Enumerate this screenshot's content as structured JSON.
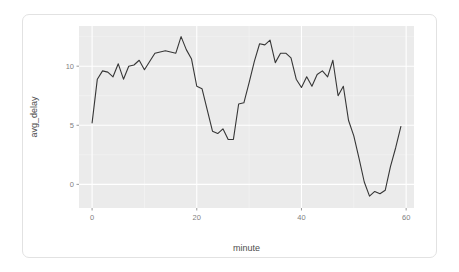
{
  "chart_data": {
    "type": "line",
    "title": "",
    "subtitle": "",
    "xlabel": "minute",
    "ylabel": "avg_delay",
    "xlim": [
      -2.5,
      61.5
    ],
    "ylim": [
      -2.0,
      13.4
    ],
    "xticks": [
      0,
      20,
      40,
      60
    ],
    "xtick_labels": [
      "0",
      "20",
      "40",
      "60"
    ],
    "yticks": [
      0,
      5,
      10
    ],
    "ytick_labels": [
      "0",
      "5",
      "10"
    ],
    "grid": true,
    "grid_major": true,
    "grid_minor": true,
    "legend": "none",
    "series": [
      {
        "name": "avg_delay",
        "color": "#363636",
        "linewidth": 1.1,
        "x": [
          0,
          1,
          2,
          3,
          4,
          5,
          6,
          7,
          8,
          9,
          10,
          11,
          12,
          13,
          14,
          15,
          16,
          17,
          18,
          19,
          20,
          21,
          22,
          23,
          24,
          25,
          26,
          27,
          28,
          29,
          30,
          31,
          32,
          33,
          34,
          35,
          36,
          37,
          38,
          39,
          40,
          41,
          42,
          43,
          44,
          45,
          46,
          47,
          48,
          49,
          50,
          51,
          52,
          53,
          54,
          55,
          56,
          57,
          58,
          59
        ],
        "values": [
          5.2,
          8.9,
          9.6,
          9.5,
          9.1,
          10.2,
          8.9,
          10.0,
          10.1,
          10.5,
          9.7,
          10.4,
          11.1,
          11.2,
          11.3,
          11.2,
          11.1,
          12.5,
          11.4,
          10.6,
          8.3,
          8.1,
          6.3,
          4.5,
          4.3,
          4.7,
          3.8,
          3.8,
          6.8,
          6.9,
          8.6,
          10.4,
          11.9,
          11.8,
          12.2,
          10.3,
          11.1,
          11.1,
          10.7,
          8.9,
          8.2,
          9.1,
          8.3,
          9.3,
          9.6,
          9.1,
          10.5,
          7.5,
          8.3,
          5.4,
          4.1,
          2.2,
          0.2,
          -1.0,
          -0.6,
          -0.8,
          -0.5,
          1.5,
          3.1,
          4.9
        ]
      }
    ]
  },
  "panel": {
    "background_color": "#ebebeb",
    "grid_major_color": "#ffffff",
    "grid_minor_color": "#f5f5f5",
    "line_color": "#363636"
  },
  "card": {
    "background_color": "#ffffff",
    "border_color": "#e2e2e2"
  }
}
